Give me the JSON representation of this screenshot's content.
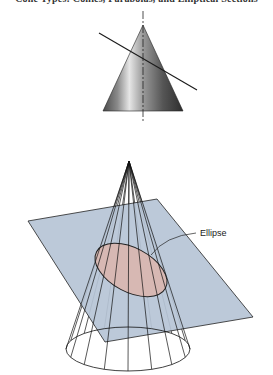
{
  "header": {
    "text": "Cone Types: Conics, Parabolas, and Elliptical Sections"
  },
  "figures": {
    "upper_cone": {
      "description": "shaded right circular cone with vertical axis and an oblique cutting plane (edge view)",
      "apex": [
        143,
        25
      ],
      "base_left": [
        103,
        111
      ],
      "base_right": [
        183,
        111
      ],
      "axis": {
        "top": [
          143,
          11
        ],
        "bottom": [
          143,
          121
        ]
      },
      "cutting_line": {
        "start": [
          99,
          33
        ],
        "end": [
          197,
          90
        ]
      },
      "colors": {
        "dark": "#4a4a4a",
        "mid": "#8a8a8a",
        "highlight": "#e6e6e6",
        "shadow": "#2e2e2e"
      }
    },
    "lower_cone": {
      "description": "wireframe cone intersected by an inclined plane producing an ellipse",
      "apex": [
        129,
        161
      ],
      "base": {
        "cx": 128,
        "cy": 349,
        "rx": 62,
        "ry": 22
      },
      "element_count": 16,
      "plane": {
        "points": [
          [
            28,
            221
          ],
          [
            157,
            199
          ],
          [
            253,
            317
          ],
          [
            105,
            342
          ]
        ],
        "color": "#b6c4d6"
      },
      "section_ellipse": {
        "cx": 131,
        "cy": 270,
        "rx": 39,
        "ry": 22,
        "rotation": 28,
        "color": "#d7b8b3"
      },
      "label": {
        "text": "Ellipse",
        "x": 200,
        "y": 236,
        "leader": "M196 233 Q165 236 151 255"
      }
    }
  }
}
